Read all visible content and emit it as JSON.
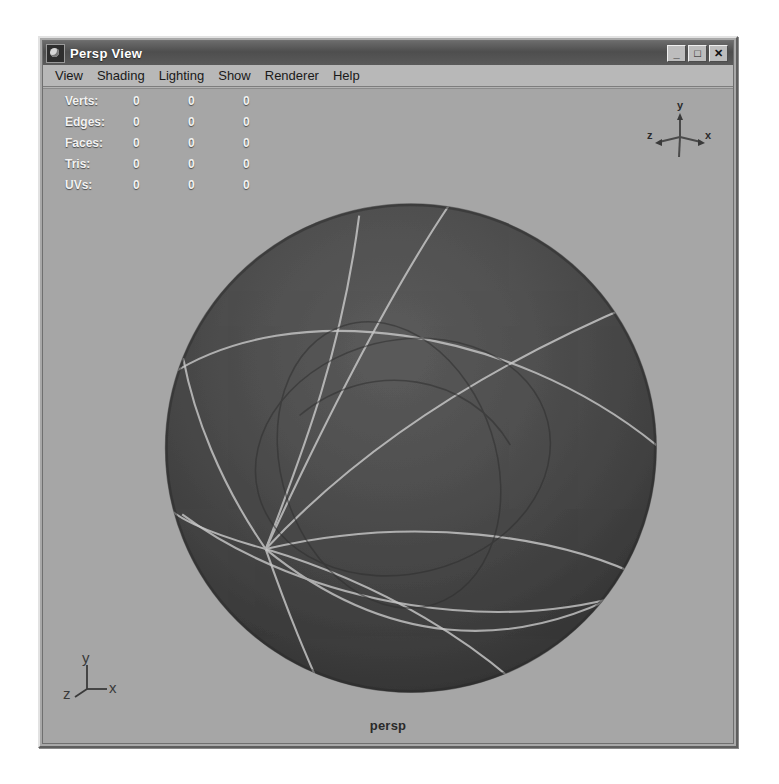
{
  "window": {
    "title": "Persp View",
    "icon": "app-sphere-icon",
    "controls": [
      {
        "name": "minimize",
        "glyph": "_"
      },
      {
        "name": "maximize",
        "glyph": "□"
      },
      {
        "name": "close",
        "glyph": "✕"
      }
    ]
  },
  "menubar": {
    "items": [
      {
        "label": "View"
      },
      {
        "label": "Shading"
      },
      {
        "label": "Lighting"
      },
      {
        "label": "Show"
      },
      {
        "label": "Renderer"
      },
      {
        "label": "Help"
      }
    ]
  },
  "hud": {
    "stats": [
      {
        "label": "Verts:",
        "c1": "0",
        "c2": "0",
        "c3": "0"
      },
      {
        "label": "Edges:",
        "c1": "0",
        "c2": "0",
        "c3": "0"
      },
      {
        "label": "Faces:",
        "c1": "0",
        "c2": "0",
        "c3": "0"
      },
      {
        "label": "Tris:",
        "c1": "0",
        "c2": "0",
        "c3": "0"
      },
      {
        "label": "UVs:",
        "c1": "0",
        "c2": "0",
        "c3": "0"
      }
    ]
  },
  "axis_gizmo": {
    "name": "view-axis-gizmo",
    "labels": {
      "x": "x",
      "y": "y",
      "z": "z"
    }
  },
  "axis_triad": {
    "name": "origin-axis-triad",
    "labels": {
      "x": "x",
      "y": "y",
      "z": "z"
    }
  },
  "viewport": {
    "camera_label": "persp",
    "object": "nurbs-sphere",
    "background_color": "#a6a6a6",
    "surface_color": "#4a4a4a",
    "wireframe_color": "#c9c9c9"
  },
  "colors": {
    "window_face": "#b3b3b3",
    "titlebar": "#4e4e4e",
    "titlebar_text": "#ffffff",
    "menu_face": "#b8b8b8",
    "viewport_bg": "#a6a6a6",
    "hud_text": "#f2f2f2",
    "sphere_dark": "#3c3c3c",
    "sphere_light": "#5a5a5a",
    "isoparm": "#c9c9c9"
  }
}
